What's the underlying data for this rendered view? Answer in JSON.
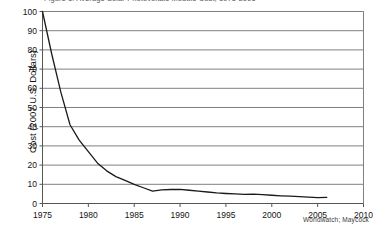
{
  "chart_data": {
    "type": "line",
    "title": "Figure 1. Average Solar Photovoltaic Module Cost, 1975-2006",
    "xlabel": "",
    "ylabel": "Cost (2007 U.S. Dollars)",
    "xlim": [
      1975,
      2010
    ],
    "ylim": [
      0,
      100
    ],
    "xticks": [
      1975,
      1980,
      1985,
      1990,
      1995,
      2000,
      2005,
      2010
    ],
    "yticks": [
      0,
      10,
      20,
      30,
      40,
      50,
      60,
      70,
      80,
      90,
      100
    ],
    "grid": "horizontal",
    "legend": "none",
    "source_note": "Worldwatch; Maycock",
    "series": [
      {
        "name": "Average solar photovoltaic module cost",
        "x": [
          1975,
          1976,
          1977,
          1978,
          1979,
          1980,
          1981,
          1982,
          1983,
          1984,
          1985,
          1986,
          1987,
          1988,
          1989,
          1990,
          1991,
          1992,
          1993,
          1994,
          1995,
          1996,
          1997,
          1998,
          1999,
          2000,
          2001,
          2002,
          2003,
          2004,
          2005,
          2006
        ],
        "values": [
          100,
          78,
          58,
          41,
          33,
          27,
          21,
          17,
          14,
          12,
          10,
          8.2,
          6.4,
          7.1,
          7.3,
          7.4,
          6.9,
          6.4,
          6.0,
          5.5,
          5.2,
          5.0,
          4.8,
          4.9,
          4.6,
          4.3,
          4.0,
          3.8,
          3.6,
          3.3,
          3.1,
          3.2
        ]
      }
    ]
  },
  "axes": {
    "y_title": "Cost (2007 U.S. Dollars)",
    "y_labels": [
      "100",
      "90",
      "80",
      "70",
      "60",
      "50",
      "40",
      "30",
      "20",
      "10",
      "0"
    ],
    "x_labels": [
      "1975",
      "1980",
      "1985",
      "1990",
      "1995",
      "2000",
      "2005",
      "2010"
    ]
  },
  "footer": {
    "source": "Worldwatch; Maycock"
  },
  "colors": {
    "background": "#ffffff",
    "grid": "#808080",
    "axis": "#555555",
    "series_line": "#1a1a1a",
    "text": "#141414"
  }
}
